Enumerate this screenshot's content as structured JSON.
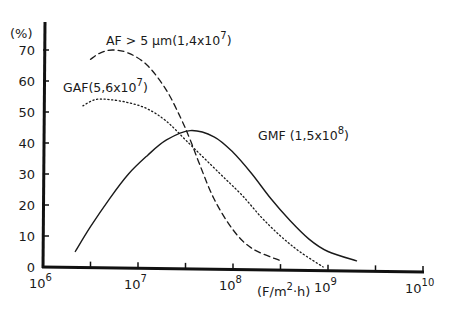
{
  "chart_data": {
    "type": "line",
    "title": "",
    "xlabel": "(F/m2·h)",
    "ylabel": "(%)",
    "xscale": "log",
    "xlim": [
      1000000,
      10000000000
    ],
    "ylim": [
      0,
      75
    ],
    "grid": false,
    "legend": "inline labels",
    "x_tick_labels": [
      {
        "base": "10",
        "exp": "6"
      },
      {
        "base": "10",
        "exp": "7"
      },
      {
        "base": "10",
        "exp": "8"
      },
      {
        "base": "10",
        "exp": "9"
      },
      {
        "base": "10",
        "exp": "10"
      }
    ],
    "y_tick_labels": [
      "0",
      "10",
      "20",
      "30",
      "40",
      "50",
      "60",
      "70"
    ],
    "series": [
      {
        "name": "AF > 5 µm (1,4x10^7)",
        "label_text": "AF > 5 µm(1,4x10",
        "label_exp": "7",
        "style": "dashed",
        "x_log10": [
          6.5,
          6.6,
          6.73,
          6.9,
          7.1,
          7.3,
          7.45,
          7.55,
          7.65,
          7.8,
          8.0,
          8.2,
          8.5
        ],
        "values": [
          67,
          69,
          70,
          69,
          65,
          57,
          48,
          41,
          33,
          22,
          12,
          6,
          2
        ]
      },
      {
        "name": "GAF (5,6x10^7)",
        "label_text": "GAF(5,6x10",
        "label_exp": "7",
        "style": "dotted",
        "x_log10": [
          6.42,
          6.55,
          6.7,
          6.9,
          7.1,
          7.3,
          7.5,
          7.7,
          7.9,
          8.1,
          8.3,
          8.5,
          8.7,
          8.95
        ],
        "values": [
          52,
          54,
          54,
          53,
          51,
          47,
          41,
          35,
          29,
          23,
          16,
          10,
          5,
          0
        ]
      },
      {
        "name": "GMF (1,5x10^8)",
        "label_text": "GMF (1,5x10",
        "label_exp": "8",
        "style": "solid",
        "x_log10": [
          6.34,
          6.5,
          6.7,
          6.9,
          7.1,
          7.3,
          7.55,
          7.8,
          8.0,
          8.2,
          8.4,
          8.6,
          8.8,
          9.0,
          9.3
        ],
        "values": [
          5,
          13,
          22,
          30,
          36,
          41,
          44,
          42,
          37,
          30,
          22,
          15,
          9,
          5,
          2
        ]
      }
    ]
  },
  "axes": {
    "y_unit": "(%)",
    "x_unit_prefix": "(F/m",
    "x_unit_exp": "2",
    "x_unit_suffix": "·h)"
  }
}
